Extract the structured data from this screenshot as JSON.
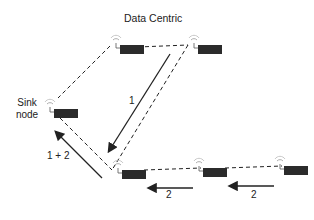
{
  "title": "Data Centric",
  "sink_label_line1": "Sink",
  "sink_label_line2": "node",
  "labels": {
    "path1": "1",
    "merged": "1 + 2",
    "path2a": "2",
    "path2b": "2"
  },
  "nodes": [
    {
      "id": "top-left",
      "x": 118,
      "y": 45
    },
    {
      "id": "top-right",
      "x": 196,
      "y": 45
    },
    {
      "id": "sink",
      "x": 52,
      "y": 110
    },
    {
      "id": "bottom-left",
      "x": 120,
      "y": 170
    },
    {
      "id": "bottom-middle",
      "x": 201,
      "y": 167
    },
    {
      "id": "bottom-right",
      "x": 282,
      "y": 165
    }
  ],
  "colors": {
    "node": "#2b2b2b",
    "line": "#222222"
  }
}
